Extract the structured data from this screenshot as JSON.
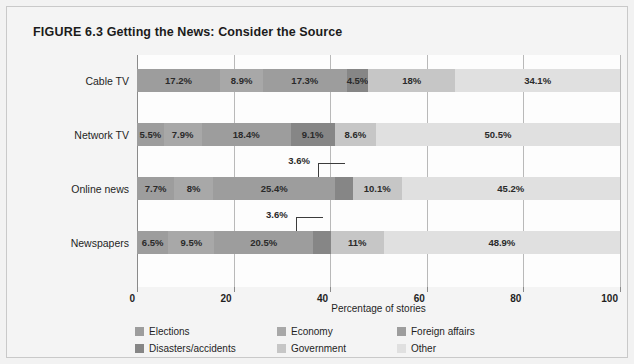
{
  "figure": {
    "number_label": "FIGURE 6.3",
    "title": "Getting the News: Consider the Source"
  },
  "chart_data": {
    "type": "bar",
    "orientation": "horizontal",
    "stacked": true,
    "stack_mode": "percent",
    "title": "Getting the News: Consider the Source",
    "xlabel": "Percentage of stories",
    "ylabel": "",
    "xlim": [
      0,
      100
    ],
    "xticks": [
      0,
      20,
      40,
      60,
      80,
      100
    ],
    "grid": true,
    "grid_axis": "x",
    "legend_position": "bottom",
    "categories": [
      "Cable TV",
      "Network TV",
      "Online news",
      "Newspapers"
    ],
    "series": [
      {
        "name": "Elections",
        "color": "#9d9d9d",
        "values": [
          17.2,
          5.5,
          7.7,
          6.5
        ],
        "labels": [
          "17.2%",
          "5.5%",
          "7.7%",
          "6.5%"
        ]
      },
      {
        "name": "Economy",
        "color": "#a8a8a8",
        "values": [
          8.9,
          7.9,
          8.0,
          9.5
        ],
        "labels": [
          "8.9%",
          "7.9%",
          "8%",
          "9.5%"
        ]
      },
      {
        "name": "Foreign affairs",
        "color": "#9d9d9d",
        "values": [
          17.3,
          18.4,
          25.4,
          20.5
        ],
        "labels": [
          "17.3%",
          "18.4%",
          "25.4%",
          "20.5%"
        ]
      },
      {
        "name": "Disasters/accidents",
        "color": "#868686",
        "values": [
          4.5,
          9.1,
          3.6,
          3.6
        ],
        "labels": [
          "4.5%",
          "9.1%",
          "3.6%",
          "3.6%"
        ]
      },
      {
        "name": "Government",
        "color": "#c6c6c6",
        "values": [
          18.0,
          8.6,
          10.1,
          11.0
        ],
        "labels": [
          "18%",
          "8.6%",
          "10.1%",
          "11%"
        ]
      },
      {
        "name": "Other",
        "color": "#e0e0e0",
        "values": [
          34.1,
          50.5,
          45.2,
          48.9
        ],
        "labels": [
          "34.1%",
          "50.5%",
          "45.2%",
          "48.9%"
        ]
      }
    ],
    "callout_labels": [
      {
        "category": "Online news",
        "series": "Disasters/accidents",
        "text": "3.6%"
      },
      {
        "category": "Newspapers",
        "series": "Disasters/accidents",
        "text": "3.6%"
      }
    ]
  },
  "axis": {
    "tick_labels": [
      "0",
      "20",
      "40",
      "60",
      "80",
      "100"
    ],
    "x_title": "Percentage of stories"
  },
  "legend": {
    "items": [
      {
        "label": "Elections",
        "color": "#9d9d9d"
      },
      {
        "label": "Economy",
        "color": "#a8a8a8"
      },
      {
        "label": "Foreign affairs",
        "color": "#9d9d9d"
      },
      {
        "label": "Disasters/accidents",
        "color": "#868686"
      },
      {
        "label": "Government",
        "color": "#c6c6c6"
      },
      {
        "label": "Other",
        "color": "#e0e0e0"
      }
    ]
  }
}
